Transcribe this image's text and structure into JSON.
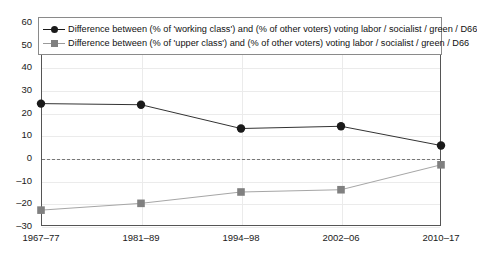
{
  "chart_data": {
    "type": "line",
    "title": "",
    "subtitle": "",
    "xlabel": "",
    "ylabel": "",
    "categories": [
      "1967–77",
      "1981–89",
      "1994–98",
      "2002–06",
      "2010–17"
    ],
    "ylim": [
      -30,
      60
    ],
    "yticks": [
      60,
      50,
      40,
      30,
      20,
      10,
      0,
      -10,
      -20,
      -30
    ],
    "ytick_labels": [
      "60",
      "50",
      "40",
      "30",
      "20",
      "10",
      "0",
      "–10",
      "–20",
      "–30"
    ],
    "grid": true,
    "zero_reference_line": 0,
    "legend_position": "top-inside",
    "series": [
      {
        "name": "Difference between (% of 'working class') and (% of other voters) voting labor / socialist / green / D66",
        "values": [
          24,
          23.5,
          13,
          14,
          5.5
        ],
        "color": "#1a1a1a",
        "marker": "circle"
      },
      {
        "name": "Difference between (% of 'upper class') and (% of other voters) voting labor / socialist / green / D66",
        "values": [
          -23,
          -20,
          -15,
          -14,
          -3
        ],
        "color": "#808080",
        "marker": "square"
      }
    ]
  }
}
